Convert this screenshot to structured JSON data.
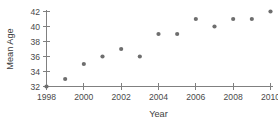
{
  "chart_data": {
    "type": "scatter",
    "title": "",
    "xlabel": "Year",
    "ylabel": "Mean Age",
    "x": [
      1998,
      1999,
      2000,
      2001,
      2002,
      2003,
      2004,
      2005,
      2006,
      2007,
      2008,
      2009,
      2010
    ],
    "values": [
      32,
      33,
      35,
      36,
      37,
      36,
      39,
      39,
      41,
      40,
      41,
      41,
      42
    ],
    "series": [
      {
        "name": "Mean Age",
        "values": [
          32,
          33,
          35,
          36,
          37,
          36,
          39,
          39,
          41,
          40,
          41,
          41,
          42
        ]
      }
    ],
    "xlim": [
      1998,
      2010
    ],
    "ylim": [
      32,
      42
    ],
    "xticks": [
      1998,
      2000,
      2002,
      2004,
      2006,
      2008,
      2010
    ],
    "xticklabels": [
      "1998",
      "2000",
      "2002",
      "2004",
      "2006",
      "2008",
      "2010"
    ],
    "yticks": [
      32,
      34,
      36,
      38,
      40,
      42
    ],
    "yticklabels": [
      "32",
      "34",
      "36",
      "38",
      "40",
      "42"
    ],
    "grid": false,
    "legend": "none",
    "marker_color": "#6e6e6e",
    "axis_color": "#808080",
    "background": "#ffffff"
  }
}
